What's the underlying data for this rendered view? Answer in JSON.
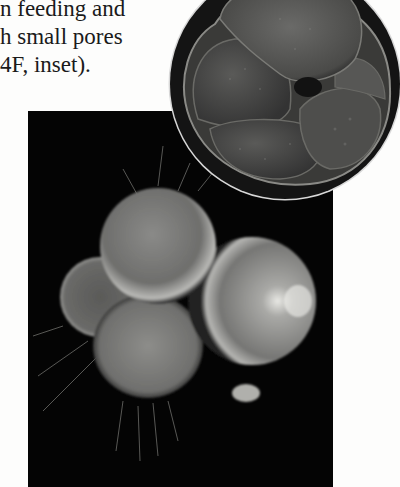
{
  "text": {
    "lines": [
      "n feeding and",
      "h small pores",
      "4F, inset)."
    ]
  },
  "figures": {
    "main_photo": {
      "subject": "foraminifera-light-micrograph",
      "background": "#040404"
    },
    "inset": {
      "subject": "foraminifera-shell-sem",
      "shape": "circle",
      "label": "inset"
    }
  }
}
